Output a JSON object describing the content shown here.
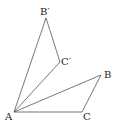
{
  "diagram": {
    "type": "geometry-rotation",
    "points": {
      "A": {
        "label": "A",
        "x": 14,
        "y": 112,
        "lx": 5,
        "ly": 120
      },
      "B": {
        "label": "B",
        "x": 101,
        "y": 75,
        "lx": 104,
        "ly": 78
      },
      "C": {
        "label": "C",
        "x": 82,
        "y": 112,
        "lx": 83,
        "ly": 120
      },
      "B1": {
        "label": "B′",
        "x": 46,
        "y": 18,
        "lx": 40,
        "ly": 15
      },
      "C1": {
        "label": "C′",
        "x": 60,
        "y": 62,
        "lx": 61,
        "ly": 65
      }
    },
    "segments": [
      [
        "A",
        "B"
      ],
      [
        "B",
        "C"
      ],
      [
        "C",
        "A"
      ],
      [
        "A",
        "B1"
      ],
      [
        "B1",
        "C1"
      ],
      [
        "C1",
        "A"
      ]
    ],
    "line_color": "#555555"
  }
}
